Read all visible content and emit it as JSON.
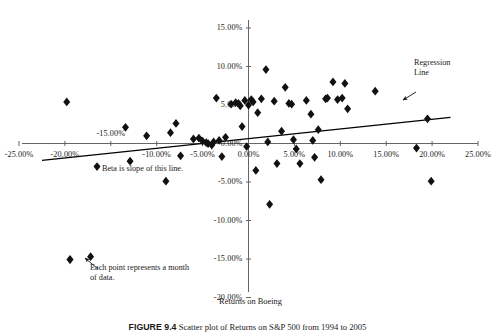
{
  "figure": {
    "caption_label": "FIGURE 9.4",
    "caption_text": "Scatter plot of Returns on S&P 500 from 1994 to 2005"
  },
  "chart_data": {
    "type": "scatter",
    "title": "",
    "xlabel": "Returns on Boeing",
    "ylabel": "",
    "xlim": [
      -25,
      25
    ],
    "ylim": [
      -20,
      15
    ],
    "grid": false,
    "legend": "none",
    "xticks": [
      "-25.00%",
      "-20.00%",
      "-15.00%",
      "-10.00%",
      "-5.00%",
      "0.00%",
      "5.00%",
      "10.00%",
      "15.00%",
      "20.00%",
      "25.00%"
    ],
    "xtick_values": [
      -25,
      -20,
      -15,
      -10,
      -5,
      0,
      5,
      10,
      15,
      20,
      25
    ],
    "yticks": [
      "15.00%",
      "10.00%",
      "5.00%",
      "0.00%",
      "-5.00%",
      "-10.00%",
      "-15.00%",
      "-20.00%"
    ],
    "ytick_values": [
      15,
      10,
      5,
      0,
      -5,
      -10,
      -15,
      -20
    ],
    "marker": "diamond",
    "marker_color": "#111111",
    "points": [
      [
        -19.8,
        5.4
      ],
      [
        -17.2,
        -14.7
      ],
      [
        -16.5,
        -3.0
      ],
      [
        -13.4,
        2.1
      ],
      [
        -12.9,
        -2.3
      ],
      [
        -11.1,
        1.0
      ],
      [
        -9.0,
        -4.9
      ],
      [
        -8.5,
        1.4
      ],
      [
        -7.9,
        2.6
      ],
      [
        -7.4,
        -1.6
      ],
      [
        -6.0,
        0.6
      ],
      [
        -5.4,
        0.7
      ],
      [
        -5.0,
        0.3
      ],
      [
        -4.6,
        0.1
      ],
      [
        -4.4,
        0.0
      ],
      [
        -4.0,
        -0.2
      ],
      [
        -3.8,
        0.2
      ],
      [
        -3.5,
        5.9
      ],
      [
        -3.2,
        0.4
      ],
      [
        -2.9,
        -1.7
      ],
      [
        -2.5,
        0.8
      ],
      [
        -1.9,
        5.1
      ],
      [
        -1.4,
        5.3
      ],
      [
        -1.1,
        5.2
      ],
      [
        -0.9,
        4.9
      ],
      [
        -0.7,
        2.2
      ],
      [
        -0.4,
        5.6
      ],
      [
        -0.2,
        -0.4
      ],
      [
        0.0,
        5.0
      ],
      [
        0.3,
        5.7
      ],
      [
        0.5,
        5.4
      ],
      [
        0.8,
        -3.5
      ],
      [
        1.0,
        4.0
      ],
      [
        1.4,
        5.8
      ],
      [
        1.9,
        9.6
      ],
      [
        2.1,
        0.2
      ],
      [
        2.3,
        -7.9
      ],
      [
        2.8,
        5.5
      ],
      [
        3.1,
        -2.6
      ],
      [
        3.6,
        1.6
      ],
      [
        4.0,
        7.3
      ],
      [
        4.4,
        5.2
      ],
      [
        4.7,
        5.1
      ],
      [
        4.9,
        0.5
      ],
      [
        5.2,
        -0.7
      ],
      [
        5.6,
        -2.6
      ],
      [
        6.3,
        5.6
      ],
      [
        6.8,
        3.8
      ],
      [
        7.0,
        0.4
      ],
      [
        7.2,
        -1.8
      ],
      [
        7.6,
        1.8
      ],
      [
        7.9,
        -4.7
      ],
      [
        8.4,
        5.8
      ],
      [
        8.6,
        5.9
      ],
      [
        9.2,
        8.0
      ],
      [
        9.7,
        5.7
      ],
      [
        10.2,
        5.9
      ],
      [
        10.5,
        7.8
      ],
      [
        10.8,
        4.5
      ],
      [
        13.8,
        6.8
      ],
      [
        18.3,
        -0.6
      ],
      [
        19.5,
        3.2
      ],
      [
        19.9,
        -4.9
      ]
    ],
    "regression_line": {
      "label": "Regression Line",
      "x_start": -22.5,
      "y_start": -2.2,
      "x_end": 22.0,
      "y_end": 3.4,
      "slope_note": "Beta is slope of this line."
    },
    "annotations": [
      {
        "name": "regression-line-annotation",
        "text_line1": "Regression",
        "text_line2": "Line"
      },
      {
        "name": "beta-annotation",
        "text": "Beta is slope of this line."
      },
      {
        "name": "point-meaning-annotation",
        "text_line1": "Each point represents a month",
        "text_line2": "of data."
      }
    ]
  },
  "colors": {
    "axis": "#555555",
    "marker": "#111111",
    "regression": "#000000",
    "text": "#1a1a1a"
  }
}
